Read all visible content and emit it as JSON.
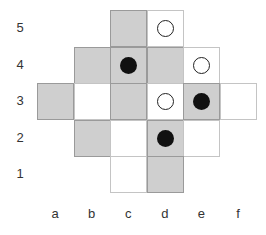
{
  "board": {
    "columns": [
      "a",
      "b",
      "c",
      "d",
      "e",
      "f"
    ],
    "rows": [
      "5",
      "4",
      "3",
      "2",
      "1"
    ],
    "colors": {
      "dark_square": "#cfcfcf",
      "light_square": "#ffffff"
    },
    "cells": [
      {
        "col": "c",
        "row": "5",
        "shade": "gray",
        "stone": null
      },
      {
        "col": "d",
        "row": "5",
        "shade": "white",
        "stone": "white"
      },
      {
        "col": "b",
        "row": "4",
        "shade": "gray",
        "stone": null
      },
      {
        "col": "c",
        "row": "4",
        "shade": "gray",
        "stone": "black"
      },
      {
        "col": "d",
        "row": "4",
        "shade": "gray",
        "stone": null
      },
      {
        "col": "e",
        "row": "4",
        "shade": "white",
        "stone": "white"
      },
      {
        "col": "a",
        "row": "3",
        "shade": "gray",
        "stone": null
      },
      {
        "col": "b",
        "row": "3",
        "shade": "white",
        "stone": null
      },
      {
        "col": "c",
        "row": "3",
        "shade": "gray",
        "stone": null
      },
      {
        "col": "d",
        "row": "3",
        "shade": "white",
        "stone": "white"
      },
      {
        "col": "e",
        "row": "3",
        "shade": "gray",
        "stone": "black"
      },
      {
        "col": "f",
        "row": "3",
        "shade": "white",
        "stone": null
      },
      {
        "col": "b",
        "row": "2",
        "shade": "gray",
        "stone": null
      },
      {
        "col": "c",
        "row": "2",
        "shade": "white",
        "stone": null
      },
      {
        "col": "d",
        "row": "2",
        "shade": "gray",
        "stone": "black"
      },
      {
        "col": "e",
        "row": "2",
        "shade": "white",
        "stone": null
      },
      {
        "col": "c",
        "row": "1",
        "shade": "white",
        "stone": null
      },
      {
        "col": "d",
        "row": "1",
        "shade": "gray",
        "stone": null
      }
    ]
  }
}
